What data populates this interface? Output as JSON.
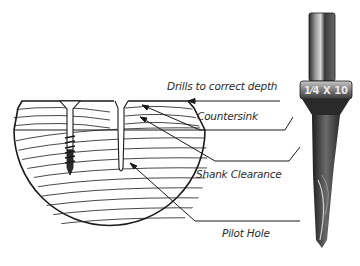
{
  "diagram": {
    "labels": {
      "depth": "Drills to correct depth",
      "countersink": "Countersink",
      "shank": "Shank Clearance",
      "pilot": "Pilot Hole"
    },
    "bit_marking": "1⁄4 X 10",
    "colors": {
      "line": "#1a1a1a",
      "text": "#2b2b2b",
      "bit_dark": "#2a2a2a",
      "bit_light": "#bdbdbd",
      "background": "#ffffff"
    }
  }
}
